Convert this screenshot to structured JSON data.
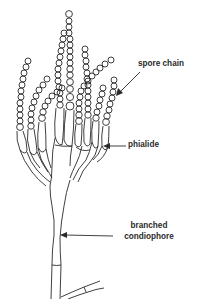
{
  "diagram": {
    "line_color": "#2a2a2a",
    "background": "#ffffff",
    "labels": {
      "spore_chain": "spore chain",
      "phialide": "phialide",
      "branched": "branched",
      "condiophore": "condiophore"
    }
  }
}
